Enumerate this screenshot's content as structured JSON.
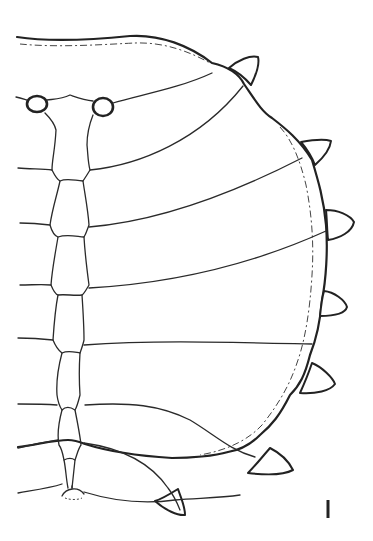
{
  "figure": {
    "line_color": "#222222",
    "background": "#ffffff",
    "scale_bar": {
      "label": "",
      "x": 328,
      "y1": 500,
      "y2": 518
    },
    "lateral_spines": 7,
    "median_segments": 8,
    "tubercles": 2
  }
}
